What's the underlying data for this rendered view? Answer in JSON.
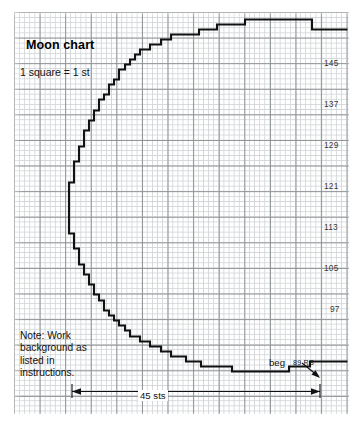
{
  "chart_data": {
    "type": "other",
    "subtype": "knitting-stitch-chart",
    "title": "Moon chart",
    "legend": "1 square = 1 st",
    "note": "Note: Work background as listed in instructions.",
    "grid": {
      "cell_size_note": "1 square = 1 st",
      "columns": 65,
      "rows": 78,
      "minor_gridline_color": "#d2d6d8",
      "major_gridline_color": "#8e9396",
      "major_every_n_cells": 5
    },
    "row_labels": [
      {
        "label": "145",
        "x": 324,
        "y": 58
      },
      {
        "label": "137",
        "x": 324,
        "y": 99
      },
      {
        "label": "129",
        "x": 324,
        "y": 140
      },
      {
        "label": "121",
        "x": 324,
        "y": 181
      },
      {
        "label": "113",
        "x": 324,
        "y": 222
      },
      {
        "label": "105",
        "x": 324,
        "y": 263
      },
      {
        "label": "97",
        "x": 330,
        "y": 304
      }
    ],
    "annotations": {
      "beg": "beg",
      "start_row": "89",
      "side": "RS",
      "width_measure": "45 sts"
    },
    "outline_color": "#111111",
    "outline_width": 2.1,
    "outline_path": "M 347.5 29.5 L 312 29.5 L 312 19.5 L 245 19.5 L 245 24.5 L 217 24.5 L 217 29.5 L 199 29.5 L 199 34.5 L 171 34.5 L 171 39.5 L 161 39.5 L 161 44.5 L 150 44.5 L 150 49.5 L 140 49.5 L 140 54.5 L 135 54.5 L 135 59.5 L 130 59.5 L 130 64.5 L 125 64.5 L 125 69.5 L 119 69.5 L 119 79.5 L 114 79.5 L 114 84.5 L 109 84.5 L 109 94.5 L 104 94.5 L 104 99.5 L 99 99.5 L 99 110.5 L 94 110.5 L 94 120.5 L 89 120.5 L 89 130.5 L 84 130.5 L 84 146.5 L 79 146.5 L 79 161.5 L 74 161.5 L 74 182.5 L 69 182.5 L 69 233.5 L 74 233.5 L 74 248.5 L 79 248.5 L 79 264.5 L 84 264.5 L 84 274.5 L 89 274.5 L 89 284.5 L 94 284.5 L 94 294.5 L 99 294.5 L 99 300.5 L 104 300.5 L 104 310.5 L 109 310.5 L 109 315.5 L 114 315.5 L 114 320.5 L 119 320.5 L 119 325.5 L 125 325.5 L 125 330.5 L 130 330.5 L 130 336.5 L 140 336.5 L 140 341.5 L 150 341.5 L 150 346.5 L 161 346.5 L 161 351.5 L 171 351.5 L 171 356.5 L 186 356.5 L 186 361.5 L 201 361.5 L 201 366.5 L 232 366.5 L 232 371.5 L 289 371.5 L 289 366.5 L 310 366.5 L 310 361.5 L 347.5 361.5",
    "measure_line": {
      "x1": 72,
      "x2": 320,
      "y": 392
    },
    "leader_line": {
      "x1": 305,
      "y1": 366,
      "x2": 320,
      "y2": 378
    }
  }
}
